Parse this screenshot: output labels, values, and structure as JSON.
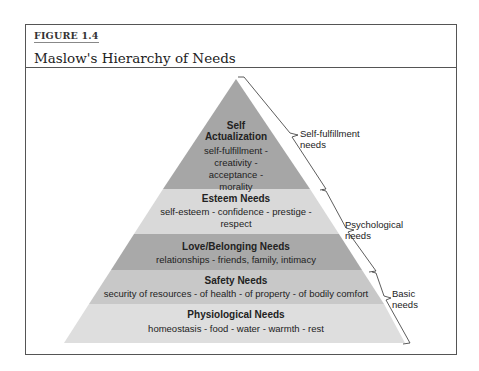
{
  "figure": {
    "number_label": "FIGURE 1.4",
    "title": "Maslow's Hierarchy of Needs"
  },
  "pyramid": {
    "colors": {
      "self_actualization": "#a6a6a6",
      "esteem": "#d9d9d9",
      "love": "#a9a9a9",
      "safety": "#c8c8c8",
      "physiological": "#dedede"
    },
    "levels": [
      {
        "title": "Self Actualization",
        "title_line1": "Self",
        "title_line2": "Actualization",
        "desc_lines": [
          "self-fulfillment -",
          "creativity -",
          "acceptance -",
          "morality"
        ]
      },
      {
        "title": "Esteem Needs",
        "desc_lines": [
          "self-esteem - confidence - prestige -",
          "respect"
        ]
      },
      {
        "title": "Love/Belonging Needs",
        "desc_lines": [
          "relationships - friends, family, intimacy"
        ]
      },
      {
        "title": "Safety Needs",
        "desc_lines": [
          "security of resources - of health - of property - of bodily comfort"
        ]
      },
      {
        "title": "Physiological Needs",
        "desc_lines": [
          "homeostasis - food - water - warmth - rest"
        ]
      }
    ]
  },
  "groups": [
    {
      "line1": "Self-fulfillment",
      "line2": "needs"
    },
    {
      "line1": "Psychological",
      "line2": "needs"
    },
    {
      "line1": "Basic",
      "line2": "needs"
    }
  ]
}
